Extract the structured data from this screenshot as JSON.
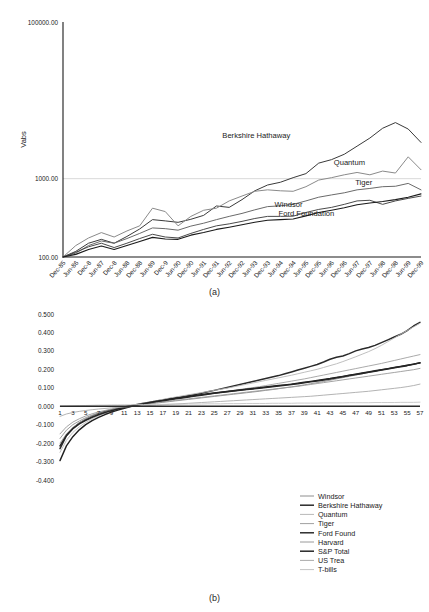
{
  "figure": {
    "caption_a": "(a)",
    "caption_b": "(b)"
  },
  "chart_data": [
    {
      "id": "panel-a",
      "type": "line",
      "title": "",
      "caption": "(a)",
      "xlabel": "",
      "ylabel": "Vabs",
      "yscale": "log",
      "ylim": [
        100.0,
        100000.0
      ],
      "ytick_labels": [
        "100000.00",
        "1000.00",
        "100.00"
      ],
      "ytick_values": [
        100000.0,
        1000.0,
        100.0
      ],
      "grid": true,
      "legend": "inline-labels",
      "x": [
        "Dec-85",
        "Jun-86",
        "Dec-8",
        "Jun-87",
        "Dec-8",
        "Jun-88",
        "Dec-88",
        "Jun-89",
        "Dec-9",
        "Jun-90",
        "Dec-90",
        "Jun-91",
        "Dec-91",
        "Jun-92",
        "Dec-92",
        "Jun-93",
        "Dec-93",
        "Jun-94",
        "Dec-94",
        "Jun-95",
        "Dec-95",
        "Jun-96",
        "Dec-96",
        "Jun-97",
        "Dec-97",
        "Jun-98",
        "Dec-98",
        "Jun-99",
        "Dec-99"
      ],
      "series": [
        {
          "name": "Berkshire Hathaway",
          "color": "#3a3a3a",
          "width": 1.0,
          "label_x": 0.54,
          "label_y": 3300,
          "values": [
            100,
            118,
            150,
            168,
            150,
            183,
            228,
            300,
            289,
            277,
            303,
            340,
            448,
            430,
            540,
            700,
            830,
            900,
            1030,
            1160,
            1580,
            1750,
            2050,
            2600,
            3300,
            4400,
            5200,
            4300,
            2900
          ]
        },
        {
          "name": "Quantum",
          "color": "#8a8a8a",
          "width": 1.0,
          "label_x": 0.8,
          "label_y": 1500,
          "values": [
            100,
            140,
            175,
            205,
            180,
            215,
            250,
            420,
            380,
            250,
            330,
            395,
            420,
            520,
            600,
            690,
            720,
            700,
            690,
            790,
            960,
            1030,
            1120,
            1200,
            1120,
            1250,
            1180,
            1900,
            1300
          ]
        },
        {
          "name": "Tiger",
          "color": "#6a6a6a",
          "width": 1.0,
          "label_x": 0.84,
          "label_y": 820,
          "values": [
            100,
            112,
            140,
            160,
            150,
            172,
            200,
            235,
            230,
            220,
            248,
            270,
            300,
            330,
            360,
            400,
            440,
            450,
            470,
            520,
            580,
            620,
            660,
            720,
            750,
            790,
            800,
            870,
            720
          ]
        },
        {
          "name": "Windsor",
          "color": "#4a4a4a",
          "width": 1.0,
          "label_x": 0.63,
          "label_y": 440,
          "values": [
            100,
            115,
            135,
            150,
            132,
            150,
            172,
            195,
            180,
            175,
            200,
            225,
            250,
            265,
            285,
            310,
            330,
            330,
            332,
            370,
            405,
            430,
            470,
            520,
            530,
            470,
            520,
            560,
            600
          ]
        },
        {
          "name": "Ford Foundation",
          "color": "#1a1a1a",
          "width": 1.1,
          "label_x": 0.68,
          "label_y": 330,
          "values": [
            100,
            108,
            125,
            138,
            125,
            140,
            158,
            178,
            170,
            168,
            190,
            205,
            225,
            240,
            258,
            278,
            295,
            300,
            305,
            335,
            370,
            395,
            425,
            465,
            490,
            510,
            540,
            580,
            640
          ]
        }
      ]
    },
    {
      "id": "panel-b",
      "type": "line",
      "title": "",
      "caption": "(b)",
      "xlabel": "",
      "ylabel": "",
      "ylim": [
        -0.4,
        0.5
      ],
      "ytick_labels": [
        "0.500",
        "0.400",
        "0.300",
        "0.200",
        "0.100",
        "0.000",
        "-0.100",
        "-0.200",
        "-0.300",
        "-0.400"
      ],
      "ytick_values": [
        0.5,
        0.4,
        0.3,
        0.2,
        0.1,
        0.0,
        -0.1,
        -0.2,
        -0.3,
        -0.4
      ],
      "xtick_labels": [
        "1",
        "3",
        "5",
        "7",
        "9",
        "11",
        "13",
        "15",
        "17",
        "19",
        "21",
        "23",
        "25",
        "27",
        "29",
        "31",
        "33",
        "35",
        "37",
        "39",
        "41",
        "43",
        "45",
        "47",
        "49",
        "51",
        "53",
        "55",
        "57"
      ],
      "xlim": [
        1,
        58
      ],
      "grid": false,
      "legend_position": "bottom-right",
      "series": [
        {
          "name": "Windsor",
          "color": "#8e8e8e",
          "width": 0.9,
          "values": [
            -0.175,
            -0.13,
            -0.1,
            -0.08,
            -0.062,
            -0.048,
            -0.036,
            -0.026,
            -0.018,
            -0.012,
            -0.006,
            -0.001,
            0.004,
            0.009,
            0.013,
            0.017,
            0.021,
            0.025,
            0.029,
            0.033,
            0.037,
            0.041,
            0.045,
            0.049,
            0.053,
            0.057,
            0.061,
            0.065,
            0.069,
            0.073,
            0.077,
            0.081,
            0.086,
            0.09,
            0.095,
            0.1,
            0.105,
            0.11,
            0.116,
            0.122,
            0.128,
            0.134,
            0.141,
            0.148,
            0.155,
            0.162,
            0.169,
            0.176,
            0.183,
            0.19,
            0.197,
            0.204,
            0.21,
            0.216,
            0.222,
            0.228,
            0.234
          ]
        },
        {
          "name": "Berkshire Hathaway",
          "color": "#2a2a2a",
          "width": 1.5,
          "values": [
            -0.23,
            -0.16,
            -0.12,
            -0.092,
            -0.072,
            -0.056,
            -0.042,
            -0.03,
            -0.02,
            -0.012,
            -0.004,
            0.003,
            0.01,
            0.016,
            0.022,
            0.028,
            0.034,
            0.04,
            0.046,
            0.052,
            0.058,
            0.064,
            0.07,
            0.078,
            0.086,
            0.094,
            0.102,
            0.11,
            0.118,
            0.126,
            0.134,
            0.142,
            0.15,
            0.158,
            0.166,
            0.176,
            0.186,
            0.196,
            0.206,
            0.216,
            0.226,
            0.24,
            0.255,
            0.265,
            0.272,
            0.285,
            0.3,
            0.31,
            0.318,
            0.33,
            0.345,
            0.36,
            0.375,
            0.39,
            0.41,
            0.435,
            0.455
          ]
        },
        {
          "name": "Quantum",
          "color": "#b8b8b8",
          "width": 0.9,
          "values": [
            -0.25,
            -0.185,
            -0.142,
            -0.112,
            -0.088,
            -0.068,
            -0.052,
            -0.038,
            -0.026,
            -0.016,
            -0.007,
            0.001,
            0.009,
            0.016,
            0.023,
            0.03,
            0.037,
            0.044,
            0.05,
            0.056,
            0.062,
            0.068,
            0.074,
            0.08,
            0.086,
            0.092,
            0.098,
            0.105,
            0.112,
            0.119,
            0.126,
            0.133,
            0.14,
            0.147,
            0.154,
            0.161,
            0.168,
            0.176,
            0.184,
            0.192,
            0.2,
            0.21,
            0.22,
            0.23,
            0.242,
            0.255,
            0.268,
            0.282,
            0.296,
            0.312,
            0.33,
            0.35,
            0.37,
            0.39,
            0.41,
            0.43,
            0.45
          ]
        },
        {
          "name": "Tiger",
          "color": "#a0a0a0",
          "width": 0.9,
          "values": [
            -0.2,
            -0.15,
            -0.115,
            -0.09,
            -0.07,
            -0.055,
            -0.042,
            -0.031,
            -0.021,
            -0.013,
            -0.005,
            0.002,
            0.008,
            0.014,
            0.02,
            0.026,
            0.031,
            0.036,
            0.041,
            0.046,
            0.051,
            0.056,
            0.061,
            0.066,
            0.071,
            0.076,
            0.081,
            0.086,
            0.091,
            0.096,
            0.101,
            0.106,
            0.112,
            0.118,
            0.124,
            0.13,
            0.136,
            0.142,
            0.148,
            0.155,
            0.162,
            0.169,
            0.176,
            0.183,
            0.19,
            0.197,
            0.204,
            0.211,
            0.218,
            0.225,
            0.232,
            0.24,
            0.248,
            0.256,
            0.264,
            0.272,
            0.28
          ]
        },
        {
          "name": "Ford Found",
          "color": "#1f1f1f",
          "width": 1.4,
          "values": [
            -0.295,
            -0.215,
            -0.165,
            -0.128,
            -0.1,
            -0.078,
            -0.06,
            -0.045,
            -0.032,
            -0.021,
            -0.011,
            -0.002,
            0.006,
            0.013,
            0.02,
            0.026,
            0.032,
            0.038,
            0.043,
            0.048,
            0.053,
            0.058,
            0.063,
            0.068,
            0.072,
            0.076,
            0.08,
            0.084,
            0.088,
            0.092,
            0.096,
            0.1,
            0.104,
            0.108,
            0.112,
            0.116,
            0.12,
            0.125,
            0.13,
            0.135,
            0.14,
            0.145,
            0.15,
            0.156,
            0.162,
            0.168,
            0.174,
            0.18,
            0.186,
            0.192,
            0.198,
            0.204,
            0.21,
            0.216,
            0.222,
            0.228,
            0.235
          ]
        },
        {
          "name": "Harvard",
          "color": "#9a9a9a",
          "width": 0.9,
          "values": [
            -0.15,
            -0.112,
            -0.086,
            -0.068,
            -0.053,
            -0.041,
            -0.031,
            -0.023,
            -0.015,
            -0.009,
            -0.003,
            0.002,
            0.007,
            0.012,
            0.016,
            0.02,
            0.024,
            0.028,
            0.032,
            0.036,
            0.04,
            0.044,
            0.048,
            0.052,
            0.056,
            0.06,
            0.064,
            0.068,
            0.072,
            0.076,
            0.08,
            0.084,
            0.088,
            0.092,
            0.096,
            0.1,
            0.104,
            0.108,
            0.113,
            0.118,
            0.123,
            0.128,
            0.133,
            0.138,
            0.143,
            0.148,
            0.153,
            0.158,
            0.163,
            0.168,
            0.173,
            0.178,
            0.183,
            0.188,
            0.193,
            0.198,
            0.205
          ]
        },
        {
          "name": "S&P Total",
          "color": "#262626",
          "width": 1.5,
          "values": [
            -0.215,
            -0.158,
            -0.122,
            -0.096,
            -0.076,
            -0.06,
            -0.046,
            -0.034,
            -0.024,
            -0.015,
            -0.007,
            0.0,
            0.007,
            0.013,
            0.019,
            0.025,
            0.03,
            0.035,
            0.04,
            0.045,
            0.05,
            0.055,
            0.06,
            0.065,
            0.07,
            0.074,
            0.078,
            0.082,
            0.086,
            0.09,
            0.094,
            0.098,
            0.102,
            0.106,
            0.11,
            0.114,
            0.118,
            0.122,
            0.127,
            0.132,
            0.137,
            0.142,
            0.148,
            0.154,
            0.16,
            0.166,
            0.172,
            0.178,
            0.184,
            0.19,
            0.196,
            0.202,
            0.208,
            0.214,
            0.22,
            0.228,
            0.236
          ]
        },
        {
          "name": "US Trea",
          "color": "#aaaaaa",
          "width": 0.9,
          "values": [
            -0.055,
            -0.042,
            -0.034,
            -0.028,
            -0.023,
            -0.019,
            -0.015,
            -0.012,
            -0.009,
            -0.006,
            -0.004,
            -0.002,
            0.0,
            0.002,
            0.004,
            0.006,
            0.008,
            0.01,
            0.012,
            0.014,
            0.016,
            0.018,
            0.02,
            0.022,
            0.024,
            0.026,
            0.028,
            0.03,
            0.032,
            0.034,
            0.036,
            0.038,
            0.04,
            0.042,
            0.044,
            0.046,
            0.048,
            0.05,
            0.052,
            0.054,
            0.057,
            0.06,
            0.063,
            0.066,
            0.069,
            0.072,
            0.075,
            0.078,
            0.081,
            0.085,
            0.089,
            0.093,
            0.097,
            0.101,
            0.106,
            0.112,
            0.12
          ]
        },
        {
          "name": "T-bills",
          "color": "#c4c4c4",
          "width": 0.9,
          "values": [
            0.0,
            0.001,
            0.002,
            0.003,
            0.004,
            0.005,
            0.006,
            0.006,
            0.007,
            0.007,
            0.008,
            0.008,
            0.009,
            0.009,
            0.01,
            0.01,
            0.01,
            0.011,
            0.011,
            0.011,
            0.012,
            0.012,
            0.012,
            0.013,
            0.013,
            0.013,
            0.014,
            0.014,
            0.014,
            0.015,
            0.015,
            0.015,
            0.015,
            0.016,
            0.016,
            0.016,
            0.016,
            0.017,
            0.017,
            0.017,
            0.017,
            0.018,
            0.018,
            0.018,
            0.018,
            0.019,
            0.019,
            0.019,
            0.019,
            0.02,
            0.02,
            0.02,
            0.02,
            0.021,
            0.021,
            0.021,
            0.022
          ]
        }
      ]
    }
  ]
}
